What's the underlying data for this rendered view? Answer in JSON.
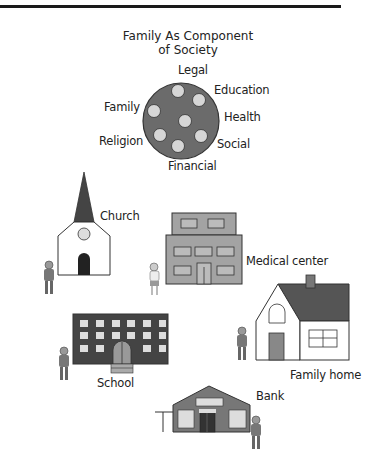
{
  "diagram": {
    "title_line1": "Family As Component",
    "title_line2": "of Society",
    "circle_labels": {
      "legal": "Legal",
      "education": "Education",
      "family": "Family",
      "health": "Health",
      "religion": "Religion",
      "social": "Social",
      "financial": "Financial"
    },
    "buildings": {
      "church": "Church",
      "medical_center": "Medical center",
      "family_home": "Family home",
      "school": "School",
      "bank": "Bank"
    },
    "colors": {
      "dark_gray": "#555555",
      "medium_gray": "#8c8c8c",
      "light_gray": "#cccccc",
      "white": "#ffffff",
      "outline": "#333333"
    }
  }
}
